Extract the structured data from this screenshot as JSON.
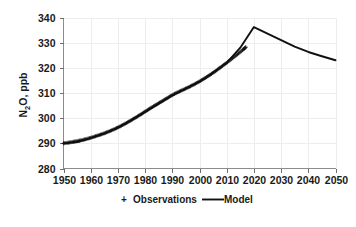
{
  "chart_data": {
    "type": "line",
    "title": "",
    "xlabel": "",
    "ylabel": "N2O, ppb",
    "ylabel_main": "N",
    "ylabel_sub": "2",
    "ylabel_rest": "O, ppb",
    "xlim": [
      1950,
      2050
    ],
    "ylim": [
      280,
      340
    ],
    "xticks": [
      1950,
      1960,
      1970,
      1980,
      1990,
      2000,
      2010,
      2020,
      2030,
      2040,
      2050
    ],
    "yticks": [
      280,
      290,
      300,
      310,
      320,
      330,
      340
    ],
    "grid": true,
    "legend_position": "bottom",
    "series": [
      {
        "name": "Observations",
        "marker": "+",
        "color": "#111111",
        "x": [
          1950,
          1952,
          1954,
          1956,
          1958,
          1960,
          1962,
          1964,
          1966,
          1968,
          1970,
          1972,
          1974,
          1976,
          1978,
          1980,
          1982,
          1984,
          1986,
          1988,
          1990,
          1992,
          1994,
          1996,
          1998,
          2000,
          2002,
          2004,
          2006,
          2008,
          2010,
          2012,
          2014,
          2016,
          2017
        ],
        "values": [
          290.0,
          290.3,
          290.7,
          291.1,
          291.6,
          292.2,
          292.9,
          293.6,
          294.4,
          295.3,
          296.3,
          297.4,
          298.6,
          299.9,
          301.2,
          302.6,
          304.0,
          305.3,
          306.6,
          307.9,
          309.2,
          310.3,
          311.3,
          312.3,
          313.4,
          314.6,
          315.9,
          317.3,
          318.8,
          320.4,
          322.0,
          323.7,
          325.4,
          327.2,
          328.2
        ]
      },
      {
        "name": "Model",
        "marker": "line",
        "color": "#111111",
        "x": [
          1950,
          1955,
          1960,
          1965,
          1970,
          1975,
          1980,
          1985,
          1990,
          1995,
          2000,
          2005,
          2010,
          2015,
          2020,
          2025,
          2030,
          2035,
          2040,
          2045,
          2050
        ],
        "values": [
          290.0,
          290.5,
          292.1,
          293.9,
          296.2,
          299.2,
          302.5,
          305.8,
          309.0,
          311.7,
          314.5,
          318.0,
          322.0,
          328.0,
          336.2,
          333.6,
          331.0,
          328.4,
          326.3,
          324.6,
          323.0
        ]
      }
    ],
    "annotations": {
      "peak_year": 2020,
      "peak_value": 336.2,
      "end_year": 2050,
      "end_value": 323.0
    }
  },
  "legend": {
    "items": [
      {
        "label": "Observations",
        "marker": "+",
        "color": "#111111"
      },
      {
        "label": "Model",
        "marker": "line",
        "color": "#111111"
      }
    ]
  },
  "colors": {
    "background": "#ffffff",
    "gridline": "#ededed",
    "axis": "#8c8c8c",
    "data": "#111111",
    "text": "#1a1a1a"
  }
}
